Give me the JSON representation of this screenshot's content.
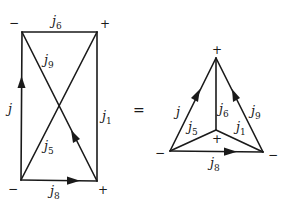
{
  "left_graph": {
    "vertices": [
      {
        "id": "tl",
        "x": 22,
        "y": 32,
        "sign": "−"
      },
      {
        "id": "tr",
        "x": 97,
        "y": 32,
        "sign": "+"
      },
      {
        "id": "bl",
        "x": 21,
        "y": 180,
        "sign": "−"
      },
      {
        "id": "br",
        "x": 97,
        "y": 181,
        "sign": "+"
      }
    ],
    "edges": [
      {
        "from": "tl",
        "to": "tr",
        "label": "j",
        "subscript": "6",
        "arrow": false
      },
      {
        "from": "bl",
        "to": "tl",
        "label": "j",
        "subscript": "",
        "arrow": true
      },
      {
        "from": "tr",
        "to": "br",
        "label": "j",
        "subscript": "1",
        "arrow": false
      },
      {
        "from": "bl",
        "to": "br",
        "label": "j",
        "subscript": "8",
        "arrow": true
      },
      {
        "from": "br",
        "to": "tl",
        "label": "j",
        "subscript": "9",
        "arrow": true
      },
      {
        "from": "bl",
        "to": "tr",
        "label": "j",
        "subscript": "5",
        "arrow": false
      }
    ],
    "signs": {
      "tl": "−",
      "tr": "+",
      "bl": "−",
      "br": "+"
    },
    "labels": {
      "j6": {
        "main": "j",
        "sub": "6"
      },
      "j9": {
        "main": "j",
        "sub": "9"
      },
      "j": {
        "main": "j",
        "sub": ""
      },
      "j1": {
        "main": "j",
        "sub": "1"
      },
      "j5": {
        "main": "j",
        "sub": "5"
      },
      "j8": {
        "main": "j",
        "sub": "8"
      }
    }
  },
  "equals": "=",
  "right_graph": {
    "vertices": [
      {
        "id": "apex",
        "x": 216,
        "y": 58,
        "sign": "+"
      },
      {
        "id": "center",
        "x": 216,
        "y": 130,
        "sign": "+"
      },
      {
        "id": "bl",
        "x": 170,
        "y": 151,
        "sign": "−"
      },
      {
        "id": "br",
        "x": 263,
        "y": 152,
        "sign": "−"
      }
    ],
    "edges": [
      {
        "from": "bl",
        "to": "apex",
        "label": "j",
        "subscript": "",
        "arrow": true
      },
      {
        "from": "br",
        "to": "apex",
        "label": "j",
        "subscript": "9",
        "arrow": true
      },
      {
        "from": "center",
        "to": "apex",
        "label": "j",
        "subscript": "6",
        "arrow": false
      },
      {
        "from": "bl",
        "to": "center",
        "label": "j",
        "subscript": "5",
        "arrow": false
      },
      {
        "from": "center",
        "to": "br",
        "label": "j",
        "subscript": "1",
        "arrow": false
      },
      {
        "from": "bl",
        "to": "br",
        "label": "j",
        "subscript": "8",
        "arrow": true
      }
    ],
    "signs": {
      "apex": "+",
      "center": "+",
      "bl": "−",
      "br": "−"
    },
    "labels": {
      "j": {
        "main": "j",
        "sub": ""
      },
      "j9": {
        "main": "j",
        "sub": "9"
      },
      "j6": {
        "main": "j",
        "sub": "6"
      },
      "j5": {
        "main": "j",
        "sub": "5"
      },
      "j1": {
        "main": "j",
        "sub": "1"
      },
      "j8": {
        "main": "j",
        "sub": "8"
      }
    }
  }
}
